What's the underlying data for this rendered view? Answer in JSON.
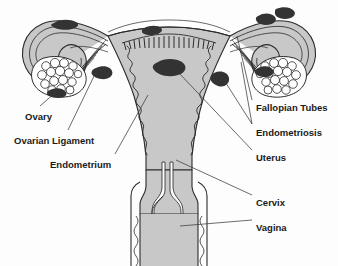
{
  "diagram": {
    "colors": {
      "background": "#fdfdfd",
      "organ_fill": "#c8c8c8",
      "wall_fill": "#d9d9d9",
      "outline": "#2b2b2b",
      "lesion": "#333333",
      "follicle_fill": "#ffffff",
      "label_text": "#1a1a1a",
      "leader_line": "#3a3a3a"
    },
    "labels": [
      {
        "id": "ovary",
        "text": "Ovary",
        "x": 25,
        "y": 112,
        "align": "left"
      },
      {
        "id": "ovarian-ligament",
        "text": "Ovarian Ligament",
        "x": 14,
        "y": 136,
        "align": "left"
      },
      {
        "id": "endometrium",
        "text": "Endometrium",
        "x": 50,
        "y": 160,
        "align": "left"
      },
      {
        "id": "fallopian-tubes",
        "text": "Fallopian Tubes",
        "x": 256,
        "y": 103,
        "align": "left"
      },
      {
        "id": "endometriosis",
        "text": "Endometriosis",
        "x": 256,
        "y": 128,
        "align": "left"
      },
      {
        "id": "uterus",
        "text": "Uterus",
        "x": 256,
        "y": 153,
        "align": "left"
      },
      {
        "id": "cervix",
        "text": "Cervix",
        "x": 256,
        "y": 198,
        "align": "left"
      },
      {
        "id": "vagina",
        "text": "Vagina",
        "x": 256,
        "y": 223,
        "align": "left"
      }
    ],
    "structures": [
      "left-ovary",
      "right-ovary",
      "left-fallopian-tube",
      "right-fallopian-tube",
      "uterus-body",
      "endometrium-lining",
      "cervix",
      "vagina",
      "broad-ligament",
      "ovarian-ligament"
    ],
    "lesion_count": 9
  }
}
